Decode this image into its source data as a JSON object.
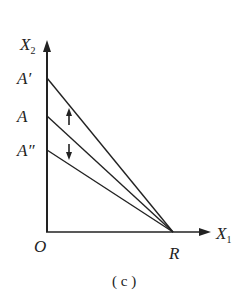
{
  "diagram": {
    "axes": {
      "y_label": "X",
      "y_sub": "2",
      "x_label": "X",
      "x_sub": "1",
      "origin": "O"
    },
    "points": {
      "a_prime": "A′",
      "a": "A",
      "a_double_prime": "A″",
      "r": "R"
    },
    "arrows": [
      "up",
      "down"
    ],
    "caption": "( c )",
    "colors": {
      "stroke": "#222222",
      "background": "#ffffff"
    }
  }
}
